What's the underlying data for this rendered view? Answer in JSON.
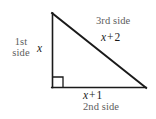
{
  "figure": {
    "type": "right-triangle-diagram",
    "background_color": "#ffffff",
    "stroke_color": "#1a1a1a",
    "label_gray": "#5d5d5d",
    "label_black": "#1a1a1a"
  },
  "geometry": {
    "vertices": {
      "apex": [
        52,
        13
      ],
      "right_angle": [
        52,
        87
      ],
      "bottom_right": [
        146,
        88
      ]
    },
    "right_angle_marker": {
      "x": 53,
      "y": 77,
      "size": 10,
      "at_vertex": "bottom-left"
    },
    "sides": [
      {
        "name": "1st side",
        "expression": "x",
        "position": "vertical-left"
      },
      {
        "name": "2nd side",
        "expression": "x + 1",
        "position": "horizontal-bottom"
      },
      {
        "name": "3rd side",
        "expression": "x + 2",
        "position": "hypotenuse"
      }
    ]
  },
  "labels": {
    "first_side_line1": "1st",
    "first_side_line2": "side",
    "leg_vertical_expr": "x",
    "third_side": "3rd side",
    "hypotenuse_var": "x",
    "hypotenuse_op": "+",
    "hypotenuse_const": "2",
    "base_var": "x",
    "base_op": "+",
    "base_const": "1",
    "second_side": "2nd side"
  }
}
